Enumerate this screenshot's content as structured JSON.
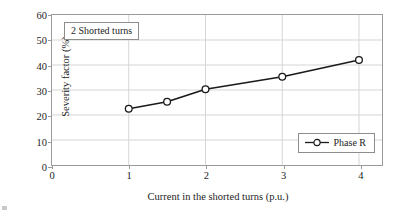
{
  "chart_data": {
    "type": "line",
    "title": "",
    "annotation": "2 Shorted turns",
    "xlabel": "Current in the shorted turns (p.u.)",
    "ylabel": "Severity factor (%)",
    "xlim": [
      0,
      4.3
    ],
    "ylim": [
      0,
      60
    ],
    "xticks": [
      0,
      1,
      2,
      3,
      4
    ],
    "yticks": [
      0,
      10,
      20,
      30,
      40,
      50,
      60
    ],
    "xtick_labels": [
      "0",
      "1",
      "2",
      "3",
      "4"
    ],
    "ytick_labels": [
      "0",
      "10",
      "20",
      "30",
      "40",
      "50",
      "60"
    ],
    "grid": true,
    "legend_position": "lower right",
    "series": [
      {
        "name": "Phase R",
        "marker": "open-circle",
        "color": "#1a1a1a",
        "x": [
          1,
          1.5,
          2,
          3,
          4
        ],
        "values": [
          22.5,
          25.3,
          30.3,
          35.3,
          42.0
        ]
      }
    ]
  },
  "legend": {
    "entries": [
      {
        "label": "Phase R",
        "marker_icon": "open-circle-marker"
      }
    ]
  },
  "colors": {
    "line": "#1a1a1a",
    "grid": "#d4d4d4",
    "frame": "#9a9a9a",
    "text": "#1c1c1c",
    "background": "#ffffff"
  }
}
